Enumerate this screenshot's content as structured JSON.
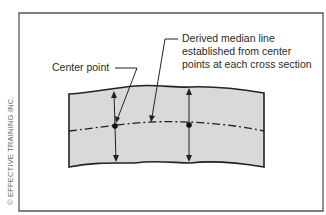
{
  "diagram": {
    "labels": {
      "center_point": "Center point",
      "median_line_1": "Derived median line",
      "median_line_2": "established from center",
      "median_line_3": "points at each cross section"
    },
    "copyright": "© EFFECTIVE TRAINING INC.",
    "colors": {
      "part_fill": "#d9d9d9",
      "outline": "#222222",
      "frame": "#555555"
    }
  }
}
